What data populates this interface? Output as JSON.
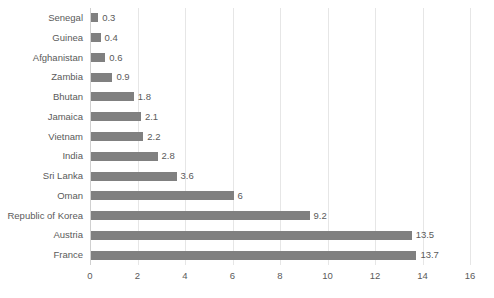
{
  "chart_data": {
    "type": "bar",
    "orientation": "horizontal",
    "title": "",
    "subtitle": "",
    "xlabel": "",
    "ylabel": "",
    "xlim": [
      0,
      16
    ],
    "xticks": [
      0,
      2,
      4,
      6,
      8,
      10,
      12,
      14,
      16
    ],
    "grid": true,
    "legend": false,
    "legend_position": "none",
    "bar_color": "#808080",
    "gridline_color": "#e6e6e6",
    "text_color": "#5a5a5a",
    "categories": [
      "Senegal",
      "Guinea",
      "Afghanistan",
      "Zambia",
      "Bhutan",
      "Jamaica",
      "Vietnam",
      "India",
      "Sri Lanka",
      "Oman",
      "Republic of Korea",
      "Austria",
      "France"
    ],
    "values": [
      0.3,
      0.4,
      0.6,
      0.9,
      1.8,
      2.1,
      2.2,
      2.8,
      3.6,
      6,
      9.2,
      13.5,
      13.7
    ],
    "value_labels": [
      "0.3",
      "0.4",
      "0.6",
      "0.9",
      "1.8",
      "2.1",
      "2.2",
      "2.8",
      "3.6",
      "6",
      "9.2",
      "13.5",
      "13.7"
    ]
  }
}
